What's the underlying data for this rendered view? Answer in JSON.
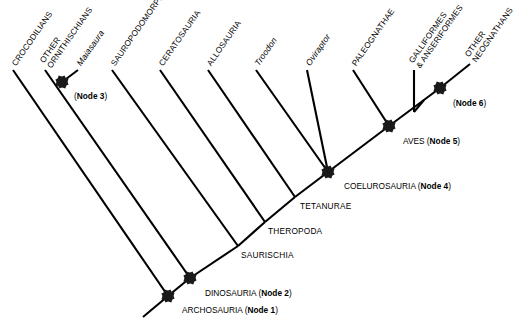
{
  "diagram": {
    "type": "cladogram",
    "background_color": "#ffffff",
    "line_color": "#000000",
    "node_marker_color": "#1a1a1a"
  },
  "taxa": [
    {
      "id": "crocodilians",
      "label": "CROCODILIANS",
      "style": "caps",
      "tip": [
        13,
        70
      ]
    },
    {
      "id": "other-ornithischians",
      "label_line1": "OTHER",
      "label_line2": "ORNITHISCHIANS",
      "style": "caps",
      "tip": [
        45,
        70
      ]
    },
    {
      "id": "maiasaura",
      "label": "Maiasaura",
      "style": "genus",
      "tip": [
        78,
        70
      ]
    },
    {
      "id": "sauropodomorpha",
      "label": "SAUROPODOMORPHA",
      "style": "caps",
      "tip": [
        112,
        70
      ]
    },
    {
      "id": "ceratosauria",
      "label": "CERATOSAURIA",
      "style": "caps",
      "tip": [
        160,
        70
      ]
    },
    {
      "id": "allosauria",
      "label": "ALLOSAURIA",
      "style": "caps",
      "tip": [
        208,
        70
      ]
    },
    {
      "id": "troodon",
      "label": "Troodon",
      "style": "genus",
      "tip": [
        256,
        70
      ]
    },
    {
      "id": "oviraptor",
      "label": "Oviraptor",
      "style": "genus",
      "tip": [
        307,
        70
      ]
    },
    {
      "id": "paleognathae",
      "label": "PALEOGNATHAE",
      "style": "caps",
      "tip": [
        353,
        70
      ]
    },
    {
      "id": "galliformes-anseriformes",
      "label_line1": "GALLIFORMES",
      "label_line2": "& ANSERIFORMES",
      "style": "caps",
      "tip": [
        414,
        70
      ]
    },
    {
      "id": "other-neognathans",
      "label_line1": "OTHER",
      "label_line2": "NEOGNATHANS",
      "style": "caps",
      "tip": [
        470,
        64
      ]
    }
  ],
  "nodes": [
    {
      "id": "node1",
      "name": "ARCHOSAURIA",
      "node_number": "Node 1",
      "label": "ARCHOSAURIA (Node 1)",
      "pos": [
        168,
        296
      ],
      "label_pos": [
        182,
        305
      ]
    },
    {
      "id": "node2",
      "name": "DINOSAURIA",
      "node_number": "Node 2",
      "label": "DINOSAURIA (Node 2)",
      "pos": [
        190,
        278
      ],
      "label_pos": [
        205,
        288
      ]
    },
    {
      "id": "node3",
      "name": "",
      "node_number": "Node 3",
      "label": "(Node 3)",
      "pos": [
        62,
        82
      ],
      "label_pos": [
        74,
        91
      ]
    },
    {
      "id": "node4",
      "name": "COELUROSAURIA",
      "node_number": "Node 4",
      "label": "COELUROSAURIA (Node 4)",
      "pos": [
        328,
        172
      ],
      "label_pos": [
        344,
        181
      ]
    },
    {
      "id": "node5",
      "name": "AVES",
      "node_number": "Node 5",
      "label": "AVES (Node 5)",
      "pos": [
        389,
        126
      ],
      "label_pos": [
        403,
        136
      ]
    },
    {
      "id": "node6",
      "name": "",
      "node_number": "Node 6",
      "label": "(Node 6)",
      "pos": [
        440,
        88
      ],
      "label_pos": [
        453,
        98
      ]
    }
  ],
  "clade_labels": [
    {
      "id": "saurischia",
      "label": "SAURISCHIA",
      "pos": [
        241,
        250
      ]
    },
    {
      "id": "theropoda",
      "label": "THEROPODA",
      "pos": [
        268,
        226
      ]
    },
    {
      "id": "tetanurae",
      "label": "TETANURAE",
      "pos": [
        300,
        201
      ]
    }
  ],
  "branches": [
    {
      "id": "backbone-root",
      "from": [
        143,
        317
      ],
      "to": [
        168,
        296
      ]
    },
    {
      "id": "backbone-n1-n2",
      "from": [
        168,
        296
      ],
      "to": [
        190,
        278
      ]
    },
    {
      "id": "backbone-n2-saurischia",
      "from": [
        190,
        278
      ],
      "to": [
        238,
        246
      ]
    },
    {
      "id": "backbone-saurischia-theropoda",
      "from": [
        238,
        246
      ],
      "to": [
        265,
        222
      ]
    },
    {
      "id": "backbone-theropoda-tetanurae",
      "from": [
        265,
        222
      ],
      "to": [
        295,
        197
      ]
    },
    {
      "id": "backbone-tetanurae-n4",
      "from": [
        295,
        197
      ],
      "to": [
        328,
        172
      ]
    },
    {
      "id": "backbone-n4-n5",
      "from": [
        328,
        172
      ],
      "to": [
        389,
        126
      ]
    },
    {
      "id": "backbone-n5-n6",
      "from": [
        389,
        126
      ],
      "to": [
        440,
        88
      ]
    },
    {
      "id": "backbone-n6-tip",
      "from": [
        440,
        88
      ],
      "to": [
        470,
        64
      ]
    },
    {
      "id": "branch-crocodilians",
      "from": [
        168,
        296
      ],
      "to": [
        13,
        70
      ]
    },
    {
      "id": "branch-ornithischia-stem",
      "from": [
        190,
        278
      ],
      "to": [
        45,
        70
      ]
    },
    {
      "id": "branch-maiasaura",
      "from": [
        62,
        82
      ],
      "to": [
        78,
        70
      ]
    },
    {
      "id": "branch-sauropodomorpha",
      "from": [
        238,
        246
      ],
      "to": [
        112,
        70
      ]
    },
    {
      "id": "branch-ceratosauria",
      "from": [
        265,
        222
      ],
      "to": [
        160,
        70
      ]
    },
    {
      "id": "branch-allosauria",
      "from": [
        295,
        197
      ],
      "to": [
        208,
        70
      ]
    },
    {
      "id": "branch-troodon",
      "from": [
        328,
        172
      ],
      "to": [
        256,
        70
      ]
    },
    {
      "id": "branch-oviraptor",
      "from": [
        328,
        172
      ],
      "to": [
        307,
        70
      ]
    },
    {
      "id": "branch-paleognathae",
      "from": [
        389,
        126
      ],
      "to": [
        353,
        70
      ]
    },
    {
      "id": "branch-galliformes",
      "from": [
        414,
        112
      ],
      "to": [
        414,
        70
      ]
    },
    {
      "id": "branch-galliformes-join",
      "from": [
        414,
        112
      ],
      "to": [
        424,
        100
      ]
    }
  ]
}
